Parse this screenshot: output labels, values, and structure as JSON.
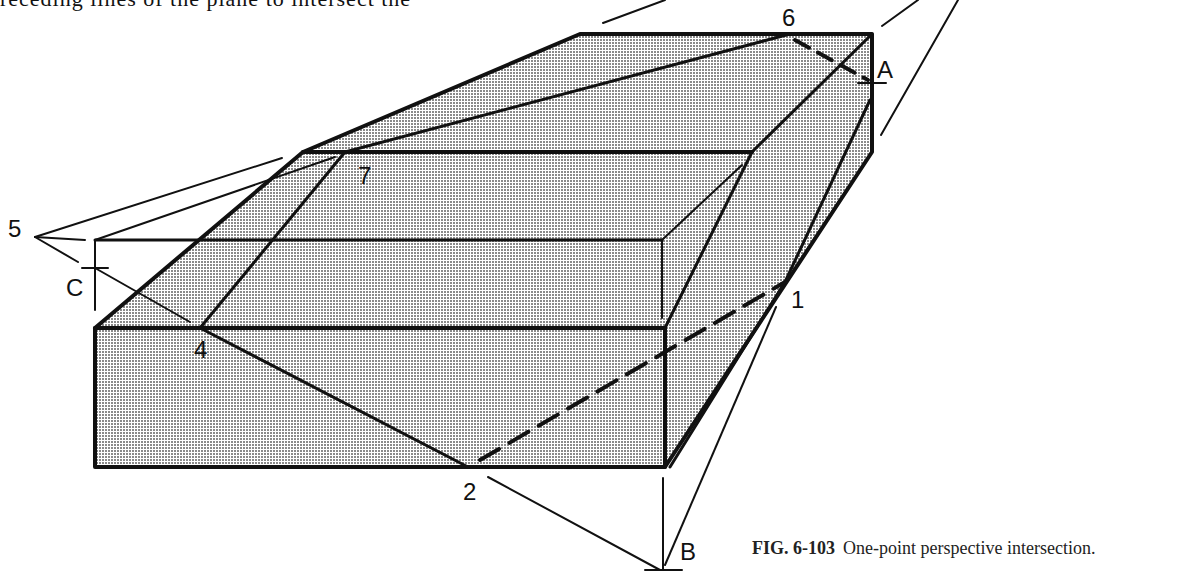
{
  "page": {
    "top_text": "receding lines of the plane to intersect the",
    "caption": {
      "figure_number": "FIG. 6-103",
      "title": "One-point perspective intersection."
    }
  },
  "diagram": {
    "title": "One-point perspective intersection",
    "shading": "halftone dot fill",
    "colors": {
      "line": "#111111",
      "fill_dot": "#7a7a7a",
      "background": "#ffffff"
    },
    "labels": {
      "p1": "1",
      "p2": "2",
      "p4": "4",
      "p5": "5",
      "p6": "6",
      "p7": "7",
      "pA": "A",
      "pB": "B",
      "pC": "C"
    }
  }
}
